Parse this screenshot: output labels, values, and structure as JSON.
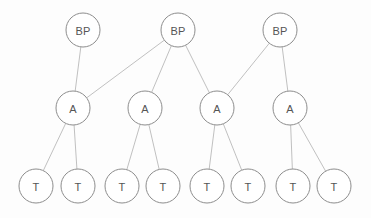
{
  "diagram": {
    "type": "tree-graph",
    "title": "",
    "background_color": "#fdfdfd",
    "node_fill_color": "#ffffff",
    "node_stroke_color": "#8d8d8d",
    "edge_color": "#b9b9b9",
    "label_color": "#555555",
    "node_radius": 17,
    "levels": [
      {
        "name": "business-process-level",
        "label_text": "BP",
        "y": 30,
        "nodes": [
          {
            "id": "bp1",
            "label": "BP",
            "x": 83,
            "y": 30
          },
          {
            "id": "bp2",
            "label": "BP",
            "x": 178,
            "y": 30
          },
          {
            "id": "bp3",
            "label": "BP",
            "x": 280,
            "y": 30
          }
        ]
      },
      {
        "name": "activity-level",
        "label_text": "A",
        "y": 108,
        "nodes": [
          {
            "id": "a1",
            "label": "A",
            "x": 73,
            "y": 108
          },
          {
            "id": "a2",
            "label": "A",
            "x": 145,
            "y": 108
          },
          {
            "id": "a3",
            "label": "A",
            "x": 217,
            "y": 108
          },
          {
            "id": "a4",
            "label": "A",
            "x": 290,
            "y": 108
          }
        ]
      },
      {
        "name": "task-level",
        "label_text": "T",
        "y": 186,
        "nodes": [
          {
            "id": "t1",
            "label": "T",
            "x": 36,
            "y": 186
          },
          {
            "id": "t2",
            "label": "T",
            "x": 78,
            "y": 186
          },
          {
            "id": "t3",
            "label": "T",
            "x": 122,
            "y": 186
          },
          {
            "id": "t4",
            "label": "T",
            "x": 163,
            "y": 186
          },
          {
            "id": "t5",
            "label": "T",
            "x": 207,
            "y": 186
          },
          {
            "id": "t6",
            "label": "T",
            "x": 248,
            "y": 186
          },
          {
            "id": "t7",
            "label": "T",
            "x": 293,
            "y": 186
          },
          {
            "id": "t8",
            "label": "T",
            "x": 334,
            "y": 186
          }
        ]
      }
    ],
    "edges": [
      {
        "from": "bp1",
        "to": "a1"
      },
      {
        "from": "bp2",
        "to": "a1"
      },
      {
        "from": "bp2",
        "to": "a2"
      },
      {
        "from": "bp2",
        "to": "a3"
      },
      {
        "from": "bp3",
        "to": "a3"
      },
      {
        "from": "bp3",
        "to": "a4"
      },
      {
        "from": "a1",
        "to": "t1"
      },
      {
        "from": "a1",
        "to": "t2"
      },
      {
        "from": "a2",
        "to": "t3"
      },
      {
        "from": "a2",
        "to": "t4"
      },
      {
        "from": "a3",
        "to": "t5"
      },
      {
        "from": "a3",
        "to": "t6"
      },
      {
        "from": "a4",
        "to": "t7"
      },
      {
        "from": "a4",
        "to": "t8"
      }
    ]
  }
}
